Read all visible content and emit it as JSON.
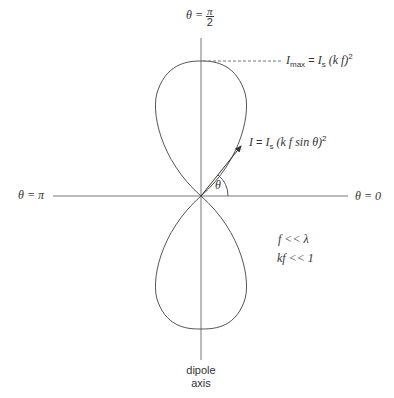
{
  "diagram": {
    "labels": {
      "theta_top_lhs": "θ =",
      "theta_top_num": "π",
      "theta_top_den": "2",
      "theta_left": "θ = π",
      "theta_right": "θ = 0",
      "theta_angle": "θ",
      "imax_I": "I",
      "imax_sub": "max",
      "imax_eq": " = ",
      "imax_Is": "I",
      "imax_Is_sub": "s",
      "imax_paren": " (k f)",
      "imax_sup": "2",
      "i_I": "I",
      "i_eq": " = ",
      "i_Is": "I",
      "i_Is_sub": "s",
      "i_paren": " (k f sin θ)",
      "i_sup": "2",
      "cond1": "f << λ",
      "cond2": "kf << 1",
      "axis_line1": "dipole",
      "axis_line2": "axis"
    },
    "colors": {
      "line": "#555555",
      "axis": "#777777",
      "text": "#333333"
    }
  }
}
